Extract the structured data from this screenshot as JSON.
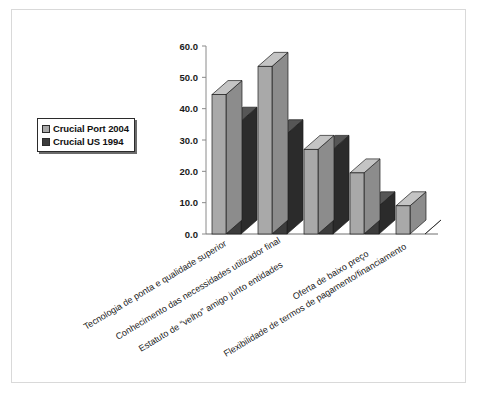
{
  "chart_data": {
    "type": "bar",
    "title": "",
    "subtitle": "",
    "xlabel": "",
    "ylabel": "",
    "ylim": [
      0,
      60
    ],
    "ytick_step": 10,
    "grid": false,
    "style": "3d-clustered-column",
    "legend_position": "left",
    "categories": [
      "Tecnologia de ponta e qualidade superior",
      "Conhecimento das necessidades utilizador final",
      "Estatuto de “velho” amigo junto entidades",
      "Oferta de baixo preço",
      "Flexibilidade de termos de pagamento/financiamento"
    ],
    "ytick_labels": [
      "0.0",
      "10.0",
      "20.0",
      "30.0",
      "40.0",
      "50.0",
      "60.0"
    ],
    "ytick_values": [
      0,
      10,
      20,
      30,
      40,
      50,
      60
    ],
    "series": [
      {
        "name": "Crucial Port 2004",
        "color": "#a9a9a9",
        "values": [
          44.5,
          53.5,
          27.0,
          19.5,
          9.0
        ]
      },
      {
        "name": "Crucial US 1994",
        "color": "#3c3c3c",
        "values": [
          36.0,
          32.0,
          27.0,
          9.0,
          0.0
        ]
      }
    ]
  },
  "legend": {
    "items": [
      {
        "label": "Crucial Port 2004",
        "color": "#a9a9a9"
      },
      {
        "label": "Crucial US 1994",
        "color": "#3c3c3c"
      }
    ]
  },
  "axis": {
    "y_labels": [
      "60.0",
      "50.0",
      "40.0",
      "30.0",
      "20.0",
      "10.0",
      "0.0"
    ]
  },
  "colors": {
    "series_light_face": "#a9a9a9",
    "series_light_top": "#c4c4c4",
    "series_light_side": "#8c8c8c",
    "series_dark_face": "#3c3c3c",
    "series_dark_top": "#565656",
    "series_dark_side": "#2b2b2b",
    "axis_line": "#8a8a8a",
    "frame_border": "#d9d9d9",
    "text": "#1a1a1a",
    "background": "#ffffff"
  }
}
